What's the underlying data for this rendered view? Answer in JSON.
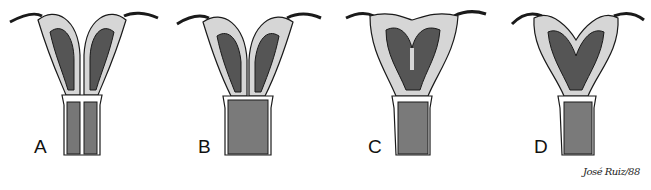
{
  "figure": {
    "panels": [
      {
        "id": "A",
        "label": "A",
        "shape": "septate-complete"
      },
      {
        "id": "B",
        "label": "B",
        "shape": "bicornuate"
      },
      {
        "id": "C",
        "label": "C",
        "shape": "septate-partial"
      },
      {
        "id": "D",
        "label": "D",
        "shape": "arcuate-bicornuate"
      }
    ],
    "signature": "José Ruiz/88",
    "colors": {
      "ink": "#1a1a1a",
      "wall": "#c9c9c9",
      "cavity": "#6a6a6a",
      "background": "#ffffff"
    }
  }
}
